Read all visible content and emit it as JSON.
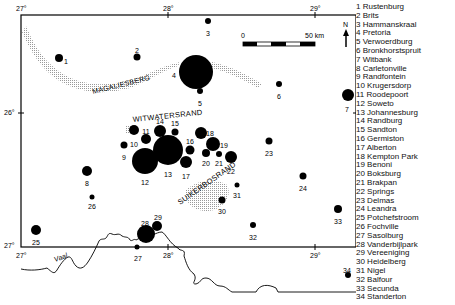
{
  "map": {
    "axes": {
      "top_ticks": [
        {
          "label": "27°",
          "x": 21
        },
        {
          "label": "28°",
          "x": 168
        },
        {
          "label": "29°",
          "x": 315
        }
      ],
      "bottom_ticks": [
        {
          "label": "27°",
          "x": 21
        },
        {
          "label": "28°",
          "x": 168
        },
        {
          "label": "29°",
          "x": 315
        }
      ],
      "left_ticks": [
        {
          "label": "26°",
          "y": 113
        },
        {
          "label": "27°",
          "y": 247
        }
      ],
      "right_ticks": [
        {
          "label": "26°",
          "y": 113
        },
        {
          "label": "27°",
          "y": 247
        }
      ]
    },
    "scale_bar": {
      "start_label": "0",
      "end_label": "50 km"
    },
    "north_label": "N",
    "region_labels": {
      "magaliesberg": "MAGALIESBERG",
      "witwatersrand": "WITWATERSRAND",
      "suikerbosrand": "SUIKERBOSRAND",
      "vaal": "Vaal"
    },
    "towns": [
      {
        "id": "1",
        "x": 59,
        "y": 58,
        "r": 4,
        "lx": 66,
        "ly": 61
      },
      {
        "id": "2",
        "x": 137,
        "y": 57,
        "r": 3.5,
        "lx": 137,
        "ly": 50
      },
      {
        "id": "3",
        "x": 208,
        "y": 21,
        "r": 3,
        "lx": 208,
        "ly": 33
      },
      {
        "id": "4",
        "x": 196,
        "y": 72,
        "r": 17,
        "lx": 174,
        "ly": 75
      },
      {
        "id": "5",
        "x": 200,
        "y": 91,
        "r": 3,
        "lx": 200,
        "ly": 103
      },
      {
        "id": "6",
        "x": 279,
        "y": 84,
        "r": 3,
        "lx": 279,
        "ly": 96
      },
      {
        "id": "7",
        "x": 348,
        "y": 95,
        "r": 6,
        "lx": 347,
        "ly": 109
      },
      {
        "id": "8",
        "x": 87,
        "y": 171,
        "r": 5,
        "lx": 87,
        "ly": 183
      },
      {
        "id": "9",
        "x": 124,
        "y": 145,
        "r": 3.5,
        "lx": 124,
        "ly": 157
      },
      {
        "id": "10",
        "x": 134,
        "y": 130,
        "r": 5,
        "lx": 134,
        "ly": 144
      },
      {
        "id": "11",
        "x": 146,
        "y": 139,
        "r": 5,
        "lx": 146,
        "ly": 131
      },
      {
        "id": "12",
        "x": 145,
        "y": 161,
        "r": 13,
        "lx": 145,
        "ly": 182
      },
      {
        "id": "13",
        "x": 168,
        "y": 150,
        "r": 15,
        "lx": 168,
        "ly": 174
      },
      {
        "id": "14",
        "x": 160,
        "y": 131,
        "r": 6,
        "lx": 160,
        "ly": 121
      },
      {
        "id": "15",
        "x": 175,
        "y": 132,
        "r": 3.5,
        "lx": 175,
        "ly": 123
      },
      {
        "id": "16",
        "x": 190,
        "y": 150,
        "r": 4.5,
        "lx": 190,
        "ly": 141
      },
      {
        "id": "17",
        "x": 186,
        "y": 162,
        "r": 6,
        "lx": 186,
        "ly": 176
      },
      {
        "id": "18",
        "x": 201,
        "y": 133,
        "r": 6,
        "lx": 210,
        "ly": 133
      },
      {
        "id": "19",
        "x": 213,
        "y": 144,
        "r": 7,
        "lx": 224,
        "ly": 145
      },
      {
        "id": "20",
        "x": 206,
        "y": 153,
        "r": 4,
        "lx": 206,
        "ly": 163
      },
      {
        "id": "21",
        "x": 219,
        "y": 154,
        "r": 3,
        "lx": 219,
        "ly": 163
      },
      {
        "id": "22",
        "x": 231,
        "y": 157,
        "r": 6,
        "lx": 231,
        "ly": 171
      },
      {
        "id": "23",
        "x": 269,
        "y": 141,
        "r": 3.5,
        "lx": 269,
        "ly": 153
      },
      {
        "id": "24",
        "x": 303,
        "y": 176,
        "r": 3.5,
        "lx": 303,
        "ly": 188
      },
      {
        "id": "25",
        "x": 36,
        "y": 230,
        "r": 5,
        "lx": 36,
        "ly": 242
      },
      {
        "id": "26",
        "x": 92,
        "y": 197,
        "r": 2.5,
        "lx": 92,
        "ly": 206
      },
      {
        "id": "27",
        "x": 137,
        "y": 247,
        "r": 2.5,
        "lx": 138,
        "ly": 258
      },
      {
        "id": "28",
        "x": 146,
        "y": 234,
        "r": 9,
        "lx": 145,
        "ly": 223
      },
      {
        "id": "29",
        "x": 157,
        "y": 226,
        "r": 5,
        "lx": 158,
        "ly": 217
      },
      {
        "id": "30",
        "x": 222,
        "y": 200,
        "r": 3.5,
        "lx": 222,
        "ly": 211
      },
      {
        "id": "31",
        "x": 237,
        "y": 185,
        "r": 2.5,
        "lx": 237,
        "ly": 195
      },
      {
        "id": "32",
        "x": 253,
        "y": 225,
        "r": 3,
        "lx": 253,
        "ly": 237
      },
      {
        "id": "33",
        "x": 338,
        "y": 209,
        "r": 4,
        "lx": 338,
        "ly": 221
      },
      {
        "id": "34",
        "x": 348,
        "y": 275,
        "r": 3,
        "lx": 347,
        "ly": 270
      }
    ]
  },
  "legend": [
    "1 Rustenburg",
    "2 Brits",
    "3 Hammanskraal",
    "4 Pretoria",
    "5 Verwoerdburg",
    "6 Bronkhorstspruit",
    "7 Witbank",
    "8 Carletonville",
    "9 Randfontein",
    "10 Krugersdorp",
    "11 Roodepoort",
    "12 Soweto",
    "13 Johannesburg",
    "14 Randburg",
    "15 Sandton",
    "16 Germiston",
    "17 Alberton",
    "18 Kempton Park",
    "19 Benoni",
    "20 Boksburg",
    "21 Brakpan",
    "22 Springs",
    "23 Delmas",
    "24 Leandra",
    "25 Potchefstroom",
    "26 Fochville",
    "27 Sasolburg",
    "28 Vanderbijlpark",
    "29 Vereeniging",
    "30 Heidelberg",
    "31 Nigel",
    "32 Balfour",
    "33 Secunda",
    "34 Standerton"
  ]
}
